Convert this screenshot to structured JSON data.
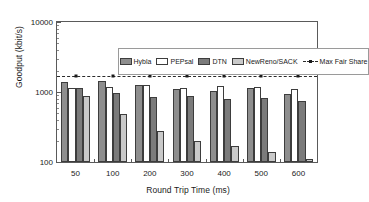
{
  "chart_data": {
    "type": "bar",
    "title": "",
    "xlabel": "Round Trip Time (ms)",
    "ylabel": "Goodput (kbit/s)",
    "categories": [
      "50",
      "100",
      "200",
      "300",
      "400",
      "500",
      "600"
    ],
    "yscale": "log",
    "ylim": [
      100,
      10000
    ],
    "yticks": [
      "100",
      "1000",
      "10000"
    ],
    "grid": false,
    "legend_position": "top-inside",
    "series": [
      {
        "name": "Hybla",
        "color": "#8e8e8e",
        "values": [
          1390,
          1430,
          1270,
          1110,
          1030,
          1150,
          930
        ]
      },
      {
        "name": "PEPsal",
        "color": "#ffffff",
        "values": [
          1130,
          1180,
          1240,
          1150,
          1230,
          1180,
          1120
        ]
      },
      {
        "name": "DTN",
        "color": "#7b7b7b",
        "values": [
          1140,
          980,
          850,
          890,
          790,
          810,
          740
        ]
      },
      {
        "name": "NewReno/SACK",
        "color": "#c9c9c9",
        "values": [
          890,
          490,
          280,
          200,
          170,
          140,
          110
        ]
      }
    ],
    "reference_line": {
      "name": "Max Fair Share",
      "value": 1700,
      "style": "dashed",
      "color": "#2b2b2b"
    }
  },
  "legend": {
    "items": [
      {
        "label": "Hybla"
      },
      {
        "label": "PEPsal"
      },
      {
        "label": "DTN"
      },
      {
        "label": "NewReno/SACK"
      },
      {
        "label": "Max Fair Share"
      }
    ]
  }
}
